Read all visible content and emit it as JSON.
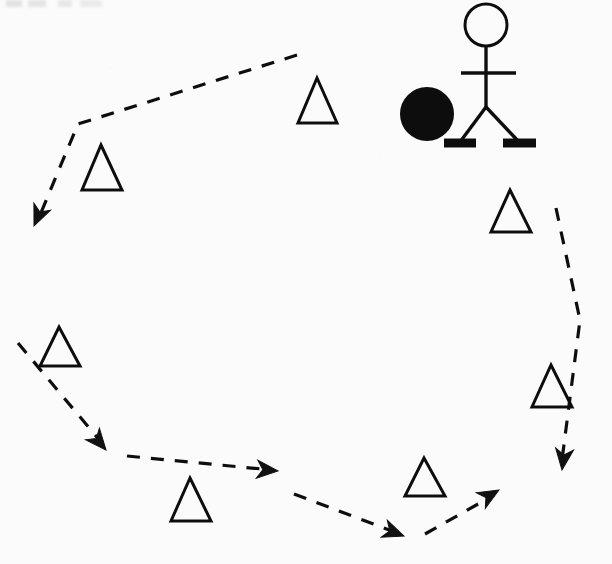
{
  "figure": {
    "background_color": "#fbfbfb",
    "ink_color": "#111111",
    "width": 612,
    "height": 564
  },
  "chart_data": {
    "type": "diagram",
    "grid": false,
    "legend": null,
    "xlabel": "",
    "ylabel": "",
    "xlim": [
      0,
      612
    ],
    "ylim": [
      0,
      564
    ],
    "cones": [
      {
        "label": "cone-1",
        "apex": [
          317,
          78
        ],
        "base_left": [
          298,
          123
        ],
        "base_right": [
          337,
          123
        ]
      },
      {
        "label": "cone-2",
        "apex": [
          101,
          145
        ],
        "base_left": [
          82,
          190
        ],
        "base_right": [
          122,
          190
        ]
      },
      {
        "label": "cone-3",
        "apex": [
          510,
          190
        ],
        "base_left": [
          491,
          232
        ],
        "base_right": [
          531,
          232
        ]
      },
      {
        "label": "cone-4",
        "apex": [
          59,
          327
        ],
        "base_left": [
          40,
          366
        ],
        "base_right": [
          80,
          366
        ]
      },
      {
        "label": "cone-5",
        "apex": [
          551,
          365
        ],
        "base_left": [
          532,
          407
        ],
        "base_right": [
          572,
          407
        ]
      },
      {
        "label": "cone-6",
        "apex": [
          424,
          458
        ],
        "base_left": [
          405,
          496
        ],
        "base_right": [
          445,
          496
        ]
      },
      {
        "label": "cone-7",
        "apex": [
          190,
          478
        ],
        "base_left": [
          171,
          521
        ],
        "base_right": [
          211,
          521
        ]
      }
    ],
    "player": {
      "head_center": [
        486,
        25
      ],
      "head_radius": 21,
      "spine": [
        [
          486,
          47
        ],
        [
          486,
          107
        ]
      ],
      "arms": [
        [
          461,
          73
        ],
        [
          516,
          73
        ]
      ],
      "left_leg": [
        [
          486,
          107
        ],
        [
          460,
          142
        ]
      ],
      "right_leg": [
        [
          486,
          107
        ],
        [
          519,
          142
        ]
      ],
      "left_foot": [
        [
          444,
          143
        ],
        [
          476,
          143
        ]
      ],
      "right_foot": [
        [
          503,
          143
        ],
        [
          536,
          143
        ]
      ]
    },
    "ball": {
      "center": [
        427,
        114
      ],
      "radius": 26,
      "filled": true
    },
    "paths": [
      {
        "label": "path-segment-1",
        "points": [
          [
            297,
            55
          ],
          [
            78,
            124
          ],
          [
            40,
            215
          ]
        ],
        "style": "dashed",
        "arrow_at_end": true
      },
      {
        "label": "path-segment-2",
        "points": [
          [
            18,
            343
          ],
          [
            101,
            442
          ]
        ],
        "style": "dashed",
        "arrow_at_end": true
      },
      {
        "label": "path-segment-3",
        "points": [
          [
            127,
            456
          ],
          [
            272,
            470
          ]
        ],
        "style": "dashed",
        "arrow_at_end": true
      },
      {
        "label": "path-segment-4",
        "points": [
          [
            294,
            494
          ],
          [
            400,
            534
          ]
        ],
        "style": "dashed",
        "arrow_at_end": true
      },
      {
        "label": "path-segment-5",
        "points": [
          [
            425,
            534
          ],
          [
            494,
            495
          ]
        ],
        "style": "dashed",
        "arrow_at_end": true
      },
      {
        "label": "path-segment-6",
        "points": [
          [
            556,
            208
          ],
          [
            580,
            320
          ],
          [
            562,
            460
          ]
        ],
        "style": "dashed",
        "arrow_at_end": true
      }
    ],
    "arrowheads": [
      {
        "label": "arrow-1",
        "tip": [
          34,
          226
        ],
        "direction_deg": 113
      },
      {
        "label": "arrow-2",
        "tip": [
          106,
          450
        ],
        "direction_deg": 50
      },
      {
        "label": "arrow-3",
        "tip": [
          278,
          471
        ],
        "direction_deg": 5
      },
      {
        "label": "arrow-4",
        "tip": [
          404,
          536
        ],
        "direction_deg": 20
      },
      {
        "label": "arrow-5",
        "tip": [
          499,
          490
        ],
        "direction_deg": -30
      },
      {
        "label": "arrow-6",
        "tip": [
          562,
          470
        ],
        "direction_deg": 97
      }
    ]
  }
}
